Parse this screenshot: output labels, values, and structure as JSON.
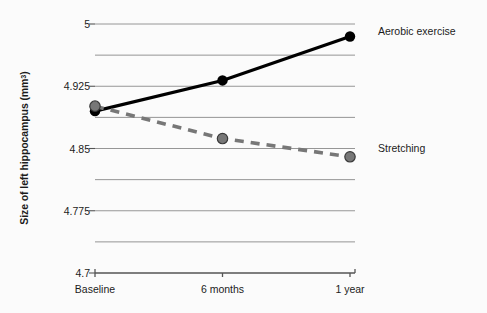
{
  "chart_data": {
    "type": "line",
    "title": "",
    "xlabel": "",
    "ylabel": "Size of left hippocampus (mm",
    "ylabel_superscript": "3",
    "ylabel_suffix": ")",
    "categories": [
      "Baseline",
      "6 months",
      "1 year"
    ],
    "ylim": [
      4.7,
      5.0
    ],
    "yticks": [
      "4.7",
      "4.775",
      "4.85",
      "4.925",
      "5"
    ],
    "ytick_values": [
      4.7,
      4.775,
      4.85,
      4.925,
      5.0
    ],
    "minor_gridlines": [
      4.7375,
      4.8125,
      4.8875,
      4.9625
    ],
    "grid": true,
    "legend_position": "inline-right",
    "series": [
      {
        "name": "Aerobic exercise",
        "values": [
          4.895,
          4.932,
          4.985
        ],
        "color": "#000000",
        "linestyle": "solid",
        "marker": "circle"
      },
      {
        "name": "Stretching",
        "values": [
          4.901,
          4.862,
          4.84
        ],
        "color": "#777777",
        "linestyle": "dashed",
        "marker": "circle"
      }
    ],
    "axis_color": "#555555",
    "grid_color": "#8a8a8a",
    "background": "#fbfbfb"
  }
}
